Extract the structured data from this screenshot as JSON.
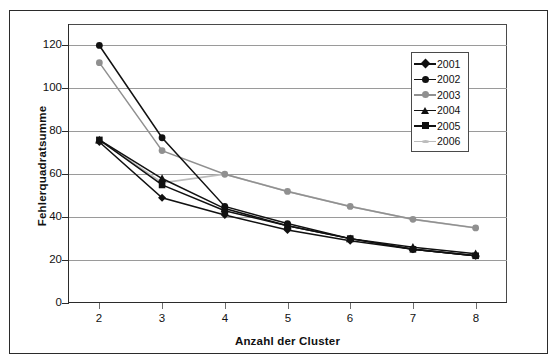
{
  "chart_data": {
    "type": "line",
    "title": "",
    "xlabel": "Anzahl der Cluster",
    "ylabel": "Fehlerquadratsumme",
    "x": [
      2,
      3,
      4,
      5,
      6,
      7,
      8
    ],
    "xtick_labels": [
      "2",
      "3",
      "4",
      "5",
      "6",
      "7",
      "8"
    ],
    "ytick_labels": [
      "0",
      "20",
      "40",
      "60",
      "80",
      "100",
      "120"
    ],
    "yticks": [
      0,
      20,
      40,
      60,
      80,
      100,
      120
    ],
    "xlim": [
      1.5,
      8.5
    ],
    "ylim": [
      0,
      130
    ],
    "grid": "horizontal",
    "legend_position": "top-right",
    "series": [
      {
        "name": "2001",
        "marker": "diamond",
        "color": "#111111",
        "values": [
          75,
          49,
          41,
          34,
          29,
          25,
          22
        ]
      },
      {
        "name": "2002",
        "marker": "circle",
        "color": "#111111",
        "values": [
          120,
          77,
          45,
          37,
          30,
          25,
          22
        ]
      },
      {
        "name": "2003",
        "marker": "circle",
        "color": "#909090",
        "values": [
          112,
          71,
          60,
          52,
          45,
          39,
          35
        ]
      },
      {
        "name": "2004",
        "marker": "triangle",
        "color": "#111111",
        "values": [
          76,
          58,
          44,
          36,
          30,
          26,
          23
        ]
      },
      {
        "name": "2005",
        "marker": "square",
        "color": "#111111",
        "values": [
          76,
          55,
          43,
          36,
          30,
          25,
          22
        ]
      },
      {
        "name": "2006",
        "marker": "dash",
        "color": "#bcbcbc",
        "values": [
          76,
          56,
          60,
          52,
          45,
          39,
          35
        ]
      }
    ]
  },
  "legend": {
    "entries": [
      {
        "label": "2001"
      },
      {
        "label": "2002"
      },
      {
        "label": "2003"
      },
      {
        "label": "2004"
      },
      {
        "label": "2005"
      },
      {
        "label": "2006"
      }
    ]
  },
  "axes": {
    "y_title": "Fehlerquadratsumme",
    "x_title": "Anzahl der Cluster"
  }
}
